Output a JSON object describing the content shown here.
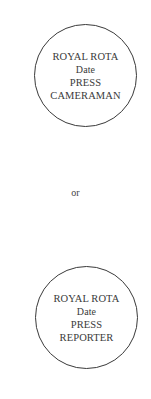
{
  "badges": [
    {
      "lines": [
        "ROYAL ROTA",
        "Date",
        "PRESS",
        "CAMERAMAN"
      ]
    },
    {
      "lines": [
        "ROYAL ROTA",
        "Date",
        "PRESS",
        "REPORTER"
      ]
    }
  ],
  "separator": "or",
  "colors": {
    "ink": "#3a3a3a",
    "background": "#ffffff"
  }
}
